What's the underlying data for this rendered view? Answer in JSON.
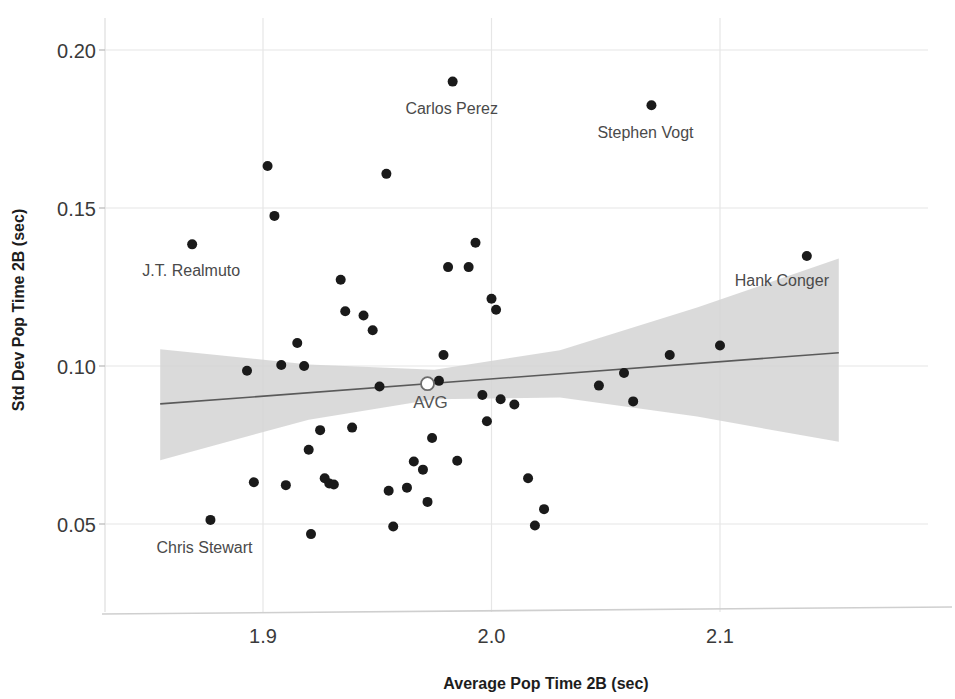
{
  "chart_data": {
    "type": "scatter",
    "title": "",
    "xlabel": "Average Pop Time 2B (sec)",
    "ylabel": "Std Dev Pop Time 2B (sec)",
    "xlim": [
      1.852,
      2.158
    ],
    "ylim": [
      0.0245,
      0.2105
    ],
    "xticks": [
      1.9,
      2.0,
      2.1
    ],
    "xtick_labels": [
      "1.9",
      "2.0",
      "2.1"
    ],
    "yticks": [
      0.05,
      0.1,
      0.15,
      0.2
    ],
    "ytick_labels": [
      "0.05",
      "0.10",
      "0.15",
      "0.20"
    ],
    "grid": true,
    "grid_color": "#e6e6e6",
    "legend": "none",
    "point_color": "#1a1a1a",
    "point_radius": 5,
    "trend_line_color": "#5a5a5a",
    "band_color": "#d4d4d4",
    "points": [
      {
        "x": 1.869,
        "y": 0.1385
      },
      {
        "x": 1.877,
        "y": 0.0513
      },
      {
        "x": 1.893,
        "y": 0.0985
      },
      {
        "x": 1.896,
        "y": 0.0632
      },
      {
        "x": 1.902,
        "y": 0.1633
      },
      {
        "x": 1.905,
        "y": 0.1475
      },
      {
        "x": 1.908,
        "y": 0.1003
      },
      {
        "x": 1.91,
        "y": 0.0623
      },
      {
        "x": 1.915,
        "y": 0.1073
      },
      {
        "x": 1.918,
        "y": 0.1
      },
      {
        "x": 1.92,
        "y": 0.0735
      },
      {
        "x": 1.921,
        "y": 0.0468
      },
      {
        "x": 1.925,
        "y": 0.0797
      },
      {
        "x": 1.927,
        "y": 0.0645
      },
      {
        "x": 1.929,
        "y": 0.0628
      },
      {
        "x": 1.931,
        "y": 0.0625
      },
      {
        "x": 1.934,
        "y": 0.1273
      },
      {
        "x": 1.936,
        "y": 0.1173
      },
      {
        "x": 1.939,
        "y": 0.0805
      },
      {
        "x": 1.944,
        "y": 0.116
      },
      {
        "x": 1.948,
        "y": 0.1113
      },
      {
        "x": 1.951,
        "y": 0.0935
      },
      {
        "x": 1.954,
        "y": 0.1608
      },
      {
        "x": 1.955,
        "y": 0.0605
      },
      {
        "x": 1.957,
        "y": 0.0492
      },
      {
        "x": 1.963,
        "y": 0.0615
      },
      {
        "x": 1.966,
        "y": 0.0698
      },
      {
        "x": 1.97,
        "y": 0.0672
      },
      {
        "x": 1.972,
        "y": 0.057
      },
      {
        "x": 1.974,
        "y": 0.0772
      },
      {
        "x": 1.977,
        "y": 0.0953
      },
      {
        "x": 1.979,
        "y": 0.1035
      },
      {
        "x": 1.981,
        "y": 0.1313
      },
      {
        "x": 1.983,
        "y": 0.19
      },
      {
        "x": 1.985,
        "y": 0.07
      },
      {
        "x": 1.99,
        "y": 0.1313
      },
      {
        "x": 1.993,
        "y": 0.139
      },
      {
        "x": 1.996,
        "y": 0.0908
      },
      {
        "x": 1.998,
        "y": 0.0825
      },
      {
        "x": 2.0,
        "y": 0.1213
      },
      {
        "x": 2.002,
        "y": 0.1178
      },
      {
        "x": 2.004,
        "y": 0.0895
      },
      {
        "x": 2.01,
        "y": 0.0878
      },
      {
        "x": 2.016,
        "y": 0.0645
      },
      {
        "x": 2.019,
        "y": 0.0495
      },
      {
        "x": 2.023,
        "y": 0.0547
      },
      {
        "x": 2.047,
        "y": 0.0938
      },
      {
        "x": 2.058,
        "y": 0.0978
      },
      {
        "x": 2.062,
        "y": 0.0888
      },
      {
        "x": 2.07,
        "y": 0.1825
      },
      {
        "x": 2.078,
        "y": 0.1035
      },
      {
        "x": 2.1,
        "y": 0.1065
      },
      {
        "x": 2.138,
        "y": 0.1348
      }
    ],
    "avg_marker": {
      "x": 1.972,
      "y": 0.0944,
      "label": "AVG",
      "style": "open-circle"
    },
    "trend_line": {
      "x1": 1.855,
      "y1": 0.088,
      "x2": 2.152,
      "y2": 0.1042
    },
    "confidence_band": {
      "upper": [
        {
          "x": 1.855,
          "y": 0.1053
        },
        {
          "x": 1.92,
          "y": 0.1005
        },
        {
          "x": 1.975,
          "y": 0.0988
        },
        {
          "x": 2.03,
          "y": 0.105
        },
        {
          "x": 2.09,
          "y": 0.1185
        },
        {
          "x": 2.152,
          "y": 0.134
        }
      ],
      "lower": [
        {
          "x": 1.855,
          "y": 0.0702
        },
        {
          "x": 1.92,
          "y": 0.083
        },
        {
          "x": 1.975,
          "y": 0.0895
        },
        {
          "x": 2.03,
          "y": 0.09
        },
        {
          "x": 2.09,
          "y": 0.084
        },
        {
          "x": 2.152,
          "y": 0.076
        }
      ]
    },
    "annotations": [
      {
        "text": "J.T. Realmuto",
        "x": 1.869,
        "y": 0.1385,
        "anchor": "end",
        "dx": 48,
        "dy": 32
      },
      {
        "text": "Chris Stewart",
        "x": 1.877,
        "y": 0.0513,
        "anchor": "middle",
        "dx": -6,
        "dy": 33
      },
      {
        "text": "Carlos Perez",
        "x": 1.983,
        "y": 0.19,
        "anchor": "middle",
        "dx": -1,
        "dy": 32
      },
      {
        "text": "Stephen Vogt",
        "x": 2.07,
        "y": 0.1825,
        "anchor": "middle",
        "dx": -6,
        "dy": 33
      },
      {
        "text": "Hank Conger",
        "x": 2.138,
        "y": 0.1348,
        "anchor": "middle",
        "dx": -25,
        "dy": 30
      }
    ]
  }
}
